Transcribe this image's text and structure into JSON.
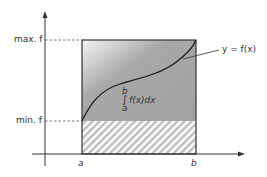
{
  "diagram": {
    "labels": {
      "max_f": "max. f",
      "min_f": "min. f",
      "a": "a",
      "b": "b",
      "function": "y = f(x)"
    },
    "integral": {
      "upper_limit": "b",
      "sign": "∫",
      "integrand": "f(x)dx",
      "lower_limit": "a"
    },
    "colors": {
      "axis": "#333333",
      "rect_fill": "#a6a6a6",
      "rect_highlight": "#f2f2f2",
      "curve": "#1a1a1a",
      "hatch": "#bdbdbd",
      "dash": "#555555",
      "text": "#333333"
    }
  }
}
